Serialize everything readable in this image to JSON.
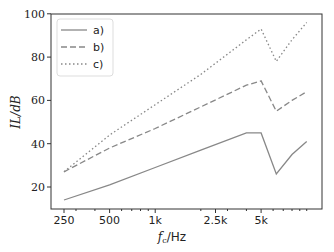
{
  "chart_data": {
    "type": "line",
    "title": "",
    "xlabel": "f_c/Hz",
    "ylabel": "IL/dB",
    "x_scale": "log",
    "xticks": [
      "250",
      "500",
      "1k",
      "2.5k",
      "5k"
    ],
    "yticks": [
      "20",
      "40",
      "60",
      "80",
      "100"
    ],
    "ylim": [
      10,
      100
    ],
    "xlim": [
      220,
      11000
    ],
    "grid": false,
    "legend_position": "upper left",
    "x": [
      250,
      500,
      1000,
      2000,
      4000,
      5000,
      6300,
      8000,
      10000
    ],
    "series": [
      {
        "name": "a)",
        "style": "solid",
        "values": [
          14,
          21,
          29,
          37,
          45,
          45,
          26,
          35,
          41
        ]
      },
      {
        "name": "b)",
        "style": "dashed",
        "values": [
          27,
          38,
          47,
          57,
          67,
          69,
          55,
          60,
          64
        ]
      },
      {
        "name": "c)",
        "style": "dotted",
        "values": [
          27,
          44,
          58,
          72,
          88,
          93,
          78,
          88,
          96
        ]
      }
    ]
  },
  "labels": {
    "xlabel_f": "f",
    "xlabel_sub": "c",
    "xlabel_rest": "/Hz",
    "ylabel_text": "IL/dB"
  }
}
